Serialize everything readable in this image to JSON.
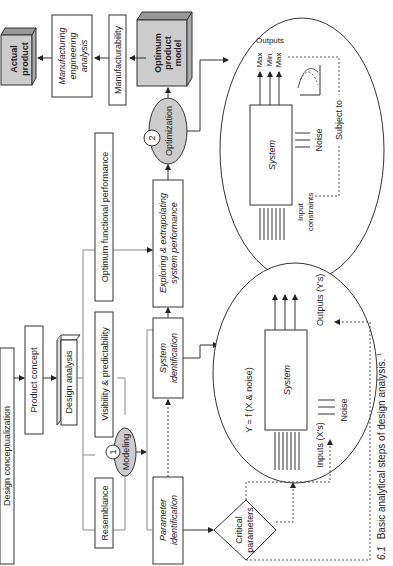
{
  "figure": {
    "caption_number": "6.1",
    "caption": "Basic analytical steps of design analysis.",
    "caption_sup": "1"
  },
  "boxes": {
    "design_conceptualization": "Design conceptualization",
    "product_concept": "Product concept",
    "design_analysis": "Design analysis",
    "resemblance": "Resemblance",
    "visibility": "Visibility & predictability",
    "optimum_functional": "Optimum functional performance",
    "parameter_identification_1": "Parameter",
    "parameter_identification_2": "identification",
    "system_identification_1": "System",
    "system_identification_2": "identification",
    "exploring_1": "Exploring & extrapolating",
    "exploring_2": "system performance",
    "critical_1": "Critical",
    "critical_2": "parameters",
    "optimum_model_1": "Optimum",
    "optimum_model_2": "product",
    "optimum_model_3": "model",
    "manufacturability": "Manufacturability",
    "mfg_analysis_1": "Manufacturing",
    "mfg_analysis_2": "engineering",
    "mfg_analysis_3": "analysis",
    "actual_product_1": "Actual",
    "actual_product_2": "product"
  },
  "steps": {
    "modeling": {
      "number": "1",
      "label": "Modeling"
    },
    "optimization": {
      "number": "2",
      "label": "Optimization"
    }
  },
  "system_model": {
    "equation": "Y = f (X & noise)",
    "system_label": "System",
    "inputs": "Inputs (X's)",
    "outputs": "Outputs (Y's)",
    "noise": "Noise"
  },
  "optimization_model": {
    "system_label": "System",
    "outputs": "Outputs",
    "max1": "Max",
    "min": "Min",
    "max2": "Max",
    "noise": "Noise",
    "input_1": "Input",
    "input_2": "constraints",
    "subject_to": "Subject to"
  }
}
